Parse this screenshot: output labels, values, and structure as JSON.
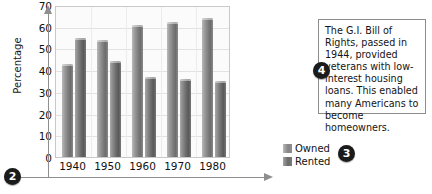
{
  "chart_data": {
    "type": "bar",
    "title": "",
    "xlabel": "",
    "ylabel": "Percentage",
    "ylim": [
      0,
      70
    ],
    "ytick_step": 10,
    "yticks": [
      "0",
      "10",
      "20",
      "30",
      "40",
      "50",
      "60",
      "70"
    ],
    "categories": [
      "1940",
      "1950",
      "1960",
      "1970",
      "1980"
    ],
    "grid": true,
    "legend_position": "bottom-right",
    "series": [
      {
        "name": "Owned",
        "values": [
          43,
          54,
          61,
          62,
          64
        ]
      },
      {
        "name": "Rented",
        "values": [
          55,
          44,
          37,
          36,
          35
        ]
      }
    ]
  },
  "axes": {
    "y_title": "Percentage",
    "y_ticks": [
      "70",
      "60",
      "50",
      "40",
      "30",
      "20",
      "10",
      "0"
    ],
    "x_ticks": [
      "1940",
      "1950",
      "1960",
      "1970",
      "1980"
    ]
  },
  "legend": {
    "items": [
      {
        "label": "Owned"
      },
      {
        "label": "Rented"
      }
    ]
  },
  "note": {
    "text": "The G.I. Bill of Rights, passed in 1944, provided veterans with low-interest housing loans. This enabled many Americans to become homeowners."
  },
  "markers": {
    "two": "2",
    "three": "3",
    "four": "4"
  },
  "colors": {
    "owned_bar": "#7e7e7e",
    "rented_bar": "#6b6b6b",
    "plot_background": "#fbfbfb",
    "plot_border": "#c9c9c9",
    "gridline": "#e2e2e2",
    "guide_arrow": "#8e8e8e",
    "marker_bubble": "#1b1b1b",
    "note_border": "#8c8c8c",
    "text": "#111111"
  }
}
